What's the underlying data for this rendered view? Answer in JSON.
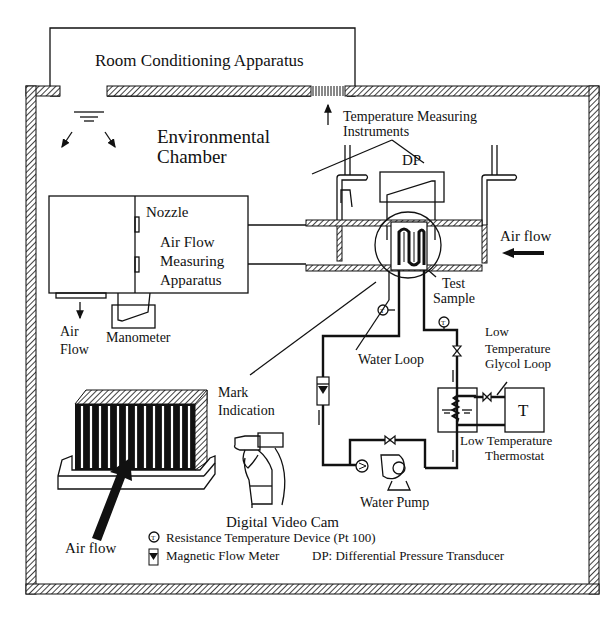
{
  "diagram": {
    "labels": {
      "room_conditioning": "Room Conditioning Apparatus",
      "environmental_1": "Environmental",
      "environmental_2": "Chamber",
      "temp_instr_1": "Temperature Measuring",
      "temp_instr_2": "Instruments",
      "dp": "DP",
      "nozzle": "Nozzle",
      "afma_1": "Air Flow",
      "afma_2": "Measuring",
      "afma_3": "Apparatus",
      "air_flow_right": "Air flow",
      "air_1": "Air",
      "air_2": "Flow",
      "manometer": "Manometer",
      "test_1": "Test",
      "test_2": "Sample",
      "water_loop": "Water Loop",
      "low": "Low",
      "low_temp": "Temperature",
      "glycol": "Glycol Loop",
      "thermostat_T": "T",
      "ltt_1": "Low Temperature",
      "ltt_2": "Thermostat",
      "water_pump": "Water Pump",
      "mark_1": "Mark",
      "mark_2": "Indication",
      "camera": "Digital Video Cam",
      "air_flow_bottom": "Air flow",
      "rtd_symbol": "T"
    },
    "legend": {
      "rtd": "Resistance Temperature Device (Pt 100)",
      "flow_meter": "Magnetic Flow Meter",
      "dp": "DP: Differential Pressure Transducer"
    },
    "colors": {
      "ink": "#111111",
      "background": "#ffffff"
    }
  }
}
